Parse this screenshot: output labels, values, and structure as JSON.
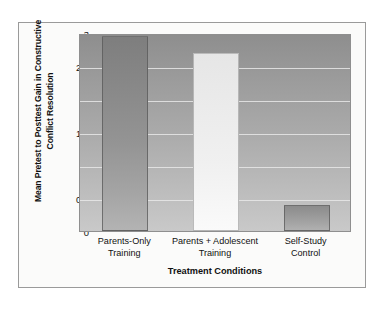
{
  "chart_data": {
    "type": "bar",
    "title": "",
    "categories": [
      "Parents-Only Training",
      "Parents + Adolescent Training",
      "Self-Study Control"
    ],
    "category_lines": [
      [
        "Parents-Only",
        "Training"
      ],
      [
        "Parents + Adolescent",
        "Training"
      ],
      [
        "Self-Study",
        "Control"
      ]
    ],
    "values": [
      2.95,
      2.7,
      0.4
    ],
    "xlabel": "Treatment Conditions",
    "ylabel": "Mean Pretest to Posttest Gain in Constructive Conflict Resolution",
    "ylim": [
      0,
      3
    ],
    "yticks": [
      "0",
      "0.5",
      "1",
      "1.5",
      "2",
      "2.5",
      "3"
    ],
    "ytick_values": [
      0,
      0.5,
      1,
      1.5,
      2,
      2.5,
      3
    ],
    "grid": true,
    "legend": "none",
    "bar_colors": [
      "#949494",
      "#f0f0f0",
      "#a4a4a4"
    ],
    "plot_background": "#a9a9a9",
    "gridline_color": "#e8e8e8",
    "frame_color": "#9a9a9a"
  }
}
